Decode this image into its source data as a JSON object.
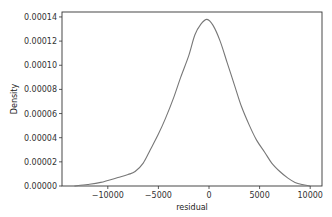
{
  "chart_data": {
    "type": "line",
    "title": "",
    "xlabel": "residual",
    "ylabel": "Density",
    "xlim": [
      -14500,
      11000
    ],
    "ylim": [
      0,
      0.000145
    ],
    "grid": false,
    "legend": null,
    "line_color": "#777777",
    "x_ticks": [
      -10000,
      -5000,
      0,
      5000,
      10000
    ],
    "x_tick_labels": [
      "−10000",
      "−5000",
      "0",
      "5000",
      "10000"
    ],
    "y_ticks": [
      0,
      2e-05,
      4e-05,
      6e-05,
      8e-05,
      0.0001,
      0.00012,
      0.00014
    ],
    "y_tick_labels": [
      "0.00000",
      "0.00002",
      "0.00004",
      "0.00006",
      "0.00008",
      "0.00010",
      "0.00012",
      "0.00014"
    ],
    "series": [
      {
        "name": "residual KDE",
        "x": [
          -13300,
          -12000,
          -10700,
          -9000,
          -8000,
          -7300,
          -6500,
          -5800,
          -5000,
          -4300,
          -3500,
          -2800,
          -2000,
          -1400,
          -800,
          -200,
          400,
          1100,
          1800,
          2500,
          3200,
          4000,
          4700,
          5500,
          6200,
          7000,
          7800,
          8500,
          9200,
          10000
        ],
        "values": [
          0.0,
          1.2e-06,
          3e-06,
          7e-06,
          9.5e-06,
          1.2e-05,
          1.9e-05,
          3e-05,
          4.3e-05,
          5.6e-05,
          7.3e-05,
          9e-05,
          0.000108,
          0.000125,
          0.000134,
          0.000138,
          0.000133,
          0.00012,
          0.000102,
          8.4e-05,
          6.6e-05,
          5e-05,
          3.8e-05,
          2.8e-05,
          1.9e-05,
          1.2e-05,
          6.5e-06,
          3e-06,
          1.2e-06,
          0.0
        ]
      }
    ]
  }
}
